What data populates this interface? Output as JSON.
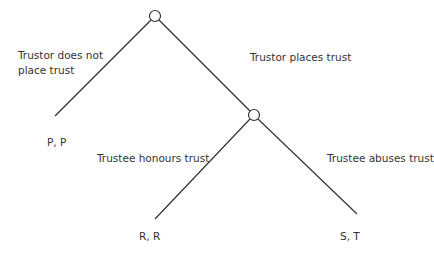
{
  "diagram": {
    "type": "game-tree",
    "colors": {
      "line": "#333333",
      "text": "#333333",
      "node_fill": "#ffffff"
    },
    "nodes": [
      {
        "id": "trustor",
        "x": 155,
        "y": 16,
        "r": 5.5
      },
      {
        "id": "trustee",
        "x": 254,
        "y": 115,
        "r": 5.5
      }
    ],
    "edges": [
      {
        "id": "not-place",
        "x1": 151,
        "y1": 20,
        "x2": 55,
        "y2": 116
      },
      {
        "id": "place",
        "x1": 159,
        "y1": 20,
        "x2": 250,
        "y2": 111
      },
      {
        "id": "honours",
        "x1": 250,
        "y1": 119,
        "x2": 155,
        "y2": 219
      },
      {
        "id": "abuses",
        "x1": 258,
        "y1": 119,
        "x2": 357,
        "y2": 214
      }
    ],
    "edge_labels": {
      "not_place_line1": "Trustor does not",
      "not_place_line2": "place trust",
      "place": "Trustor places trust",
      "honours": "Trustee honours trust",
      "abuses": "Trustee abuses trust"
    },
    "payoffs": {
      "not_place": "P, P",
      "honours": "R, R",
      "abuses": "S, T"
    }
  }
}
